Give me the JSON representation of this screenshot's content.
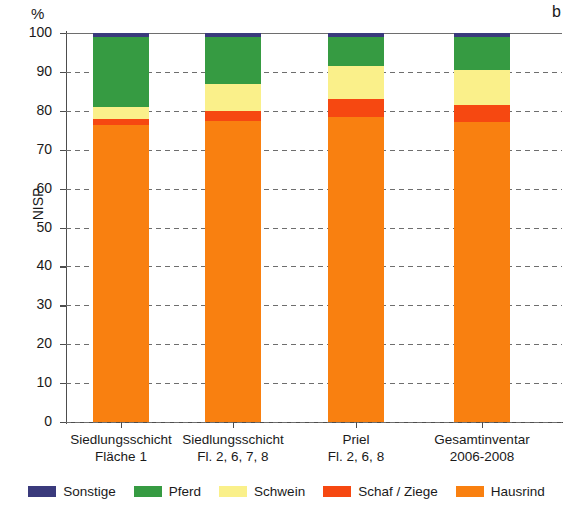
{
  "unit_label": "%",
  "panel_letter": "b",
  "y_axis_title": "NISP",
  "chart_data": {
    "type": "bar",
    "subtype": "stacked-percentage",
    "title": "",
    "panel_label": "b",
    "xlabel": "",
    "ylabel": "NISP",
    "yunit": "%",
    "ylim": [
      0,
      100
    ],
    "yticks": [
      0,
      10,
      20,
      30,
      40,
      50,
      60,
      70,
      80,
      90,
      100
    ],
    "grid": "horizontal-dashed",
    "legend_position": "bottom",
    "categories": [
      "Siedlungsschicht Fläche 1",
      "Siedlungsschicht Fl. 2, 6, 7, 8",
      "Priel Fl. 2, 6, 8",
      "Gesamtinventar 2006-2008"
    ],
    "category_lines": [
      [
        "Siedlungsschicht",
        "Fläche 1"
      ],
      [
        "Siedlungsschicht",
        "Fl. 2, 6, 7, 8"
      ],
      [
        "Priel",
        "Fl. 2, 6, 8"
      ],
      [
        "Gesamtinventar",
        "2006-2008"
      ]
    ],
    "series": [
      {
        "name": "Hausrind",
        "color": "#F98010",
        "values": [
          76.3,
          77.5,
          78.3,
          77.0
        ]
      },
      {
        "name": "Schaf / Ziege",
        "color": "#F64811",
        "values": [
          1.7,
          2.5,
          4.7,
          4.5
        ]
      },
      {
        "name": "Schwein",
        "color": "#FAF08A",
        "values": [
          3.0,
          7.0,
          8.5,
          9.0
        ]
      },
      {
        "name": "Pferd",
        "color": "#369B42",
        "values": [
          18.0,
          12.0,
          7.5,
          8.5
        ]
      },
      {
        "name": "Sonstige",
        "color": "#3A3A7C",
        "values": [
          1.0,
          1.0,
          1.0,
          1.0
        ]
      }
    ],
    "stack_order_bottom_to_top": [
      "Hausrind",
      "Schaf / Ziege",
      "Schwein",
      "Pferd",
      "Sonstige"
    ]
  },
  "legend": {
    "items": [
      {
        "label": "Sonstige",
        "color": "#3A3A7C"
      },
      {
        "label": "Pferd",
        "color": "#369B42"
      },
      {
        "label": "Schwein",
        "color": "#FAF08A"
      },
      {
        "label": "Schaf / Ziege",
        "color": "#F64811"
      },
      {
        "label": "Hausrind",
        "color": "#F98010"
      }
    ]
  }
}
